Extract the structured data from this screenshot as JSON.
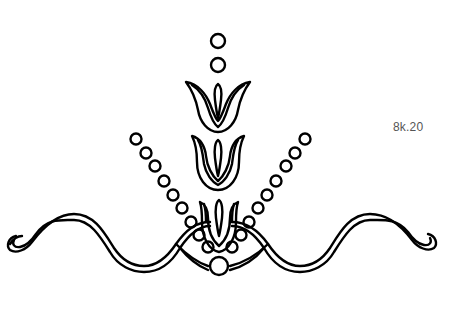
{
  "label": "8k.20",
  "colors": {
    "stroke": "#000000",
    "background": "#ffffff",
    "label": "#555555"
  },
  "design": {
    "name": "ornamental tulip border motif",
    "top_dots": [
      {
        "cx": 218,
        "cy": 41,
        "r": 7
      },
      {
        "cx": 218,
        "cy": 65,
        "r": 7
      }
    ],
    "bottom_dot": {
      "cx": 219,
      "cy": 266,
      "r": 9
    },
    "left_chain": [
      {
        "cx": 136,
        "cy": 139
      },
      {
        "cx": 146,
        "cy": 153
      },
      {
        "cx": 155,
        "cy": 166
      },
      {
        "cx": 164,
        "cy": 181
      },
      {
        "cx": 173,
        "cy": 195
      },
      {
        "cx": 182,
        "cy": 208
      },
      {
        "cx": 191,
        "cy": 222
      },
      {
        "cx": 199,
        "cy": 235
      },
      {
        "cx": 208,
        "cy": 247
      }
    ],
    "right_chain": [
      {
        "cx": 305,
        "cy": 139
      },
      {
        "cx": 295,
        "cy": 153
      },
      {
        "cx": 286,
        "cy": 166
      },
      {
        "cx": 276,
        "cy": 181
      },
      {
        "cx": 267,
        "cy": 195
      },
      {
        "cx": 258,
        "cy": 208
      },
      {
        "cx": 249,
        "cy": 222
      },
      {
        "cx": 241,
        "cy": 235
      },
      {
        "cx": 232,
        "cy": 247
      }
    ],
    "chain_dot_radius": 5.5,
    "tulip_count": 3
  }
}
